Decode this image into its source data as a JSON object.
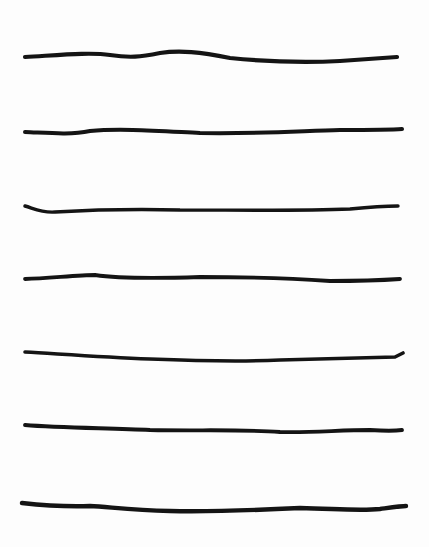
{
  "worksheet": {
    "type": "handwriting-lines",
    "line_color": "#141414",
    "background": "#fdfdfd",
    "lines": [
      {
        "index": 1,
        "path": "M25,57 C60,55 90,52 110,55 C130,58 140,57 160,53 C180,50 200,52 230,58 C270,62 300,63 340,61 C370,59 385,58 397,57",
        "width": 4.2
      },
      {
        "index": 2,
        "path": "M25,132 C50,133 70,135 90,131 C120,128 160,131 200,133 C260,134 300,131 340,130 C370,130 390,130 402,129",
        "width": 4.0
      },
      {
        "index": 3,
        "path": "M25,206 C35,209 42,213 55,212 C90,210 140,209 180,210 C240,210 300,211 350,209 C370,207 385,206 398,206",
        "width": 3.4
      },
      {
        "index": 4,
        "path": "M25,279 C50,278 80,275 95,275 C115,278 140,279 200,277 C260,277 300,279 330,281 C360,281 385,280 400,279",
        "width": 3.8
      },
      {
        "index": 5,
        "path": "M25,352 C60,354 100,357 150,359 C200,361 240,362 280,360 C320,359 360,358 395,357 L403,353",
        "width": 3.6
      },
      {
        "index": 6,
        "path": "M25,425 C60,428 110,428 150,430 C200,431 240,429 280,432 C310,433 340,430 370,430 C385,431 395,431 402,430",
        "width": 3.8
      },
      {
        "index": 7,
        "path": "M22,503 C40,505 60,507 90,506 C110,507 130,510 170,511 C220,512 260,510 300,508 C340,509 360,511 380,509 C395,507 402,506 406,506",
        "width": 4.4
      }
    ]
  }
}
